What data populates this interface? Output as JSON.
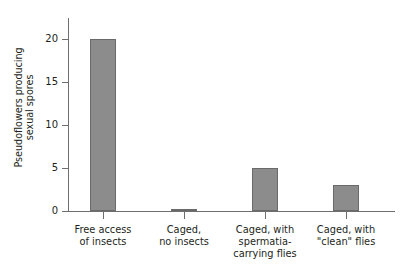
{
  "chart_data": {
    "type": "bar",
    "title": "",
    "xlabel": "",
    "ylabel": "Pseudoflowers producing sexual spores",
    "ylabel_lines": [
      "Pseudoflowers producing",
      "sexual spores"
    ],
    "categories": [
      "Free access of insects",
      "Caged, no insects",
      "Caged, with spermatia-carrying flies",
      "Caged, with \"clean\" flies"
    ],
    "category_label_lines": [
      [
        "Free access",
        "of insects"
      ],
      [
        "Caged,",
        "no insects"
      ],
      [
        "Caged, with",
        "spermatia-",
        "carrying flies"
      ],
      [
        "Caged, with",
        "\"clean\" flies"
      ]
    ],
    "values": [
      20,
      0.2,
      5,
      3
    ],
    "ylim": [
      0,
      22.5
    ],
    "yticks": [
      0,
      5,
      10,
      15,
      20
    ],
    "ytick_labels": [
      "0",
      "5",
      "10",
      "15",
      "20"
    ],
    "grid": false,
    "legend": false,
    "bar_color": "#8c8c8c",
    "bar_border_color": "#6a6a6a",
    "axis_color": "#6d6e70",
    "text_color": "#231f20",
    "background": "#ffffff"
  }
}
